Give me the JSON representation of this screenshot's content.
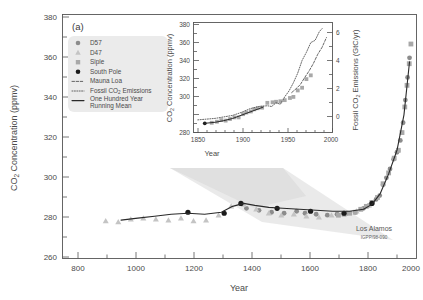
{
  "figure": {
    "panel_label": "(a)",
    "background_color": "#ffffff",
    "credit": {
      "organization": "Los Alamos",
      "report_number": "IGPP/98-090"
    }
  },
  "legend": {
    "background_color": "#ebebeb",
    "items": [
      {
        "label": "D57",
        "marker": "circle",
        "color": "#8c8c8c"
      },
      {
        "label": "D47",
        "marker": "triangle",
        "color": "#c4c4c4"
      },
      {
        "label": "Siple",
        "marker": "square",
        "color": "#a8a8a8"
      },
      {
        "label": "South Pole",
        "marker": "circle",
        "color": "#1a1a1a"
      },
      {
        "label": "Mauna Loa",
        "marker": "dashed-line",
        "color": "#555555"
      },
      {
        "label": "Fossil CO2 Emissions",
        "marker": "dotted-line",
        "color": "#555555"
      },
      {
        "label": "One Hundred Year Running Mean",
        "marker": "solid-line",
        "color": "#2a2a2a"
      }
    ]
  },
  "chart_data": {
    "type": "scatter",
    "title": "",
    "xlabel": "Year",
    "ylabel": "CO2 Concentration (ppmv)",
    "xlim": [
      750,
      2020
    ],
    "ylim": [
      258,
      382
    ],
    "xticks": [
      800,
      1000,
      1200,
      1400,
      1600,
      1800,
      2000
    ],
    "yticks": [
      260,
      280,
      300,
      320,
      340,
      360,
      380
    ],
    "grid": false,
    "legend_position": "upper-left",
    "series": [
      {
        "name": "D57",
        "marker": "circle",
        "color": "#8c8c8c",
        "points": [
          [
            1410,
            283.5
          ],
          [
            1455,
            282.5
          ],
          [
            1500,
            281.5
          ],
          [
            1545,
            281.0
          ],
          [
            1590,
            282.0
          ],
          [
            1620,
            281.0
          ],
          [
            1660,
            280.5
          ],
          [
            1700,
            280.0
          ],
          [
            1735,
            280.5
          ],
          [
            1770,
            281.0
          ],
          [
            1800,
            281.5
          ],
          [
            1830,
            283.5
          ],
          [
            1850,
            285.0
          ],
          [
            1862,
            286.5
          ],
          [
            1875,
            288.0
          ],
          [
            1888,
            290.0
          ],
          [
            1900,
            295.5
          ],
          [
            1912,
            299.0
          ],
          [
            1925,
            303.5
          ],
          [
            1938,
            308.5
          ],
          [
            1950,
            312.0
          ],
          [
            1962,
            318.0
          ],
          [
            1972,
            327.0
          ],
          [
            1980,
            338.5
          ],
          [
            1988,
            350.0
          ],
          [
            1995,
            360.0
          ]
        ]
      },
      {
        "name": "D47",
        "marker": "triangle",
        "color": "#c4c4c4",
        "points": [
          [
            905,
            277.0
          ],
          [
            950,
            276.5
          ],
          [
            995,
            278.0
          ],
          [
            1040,
            278.5
          ],
          [
            1085,
            278.0
          ],
          [
            1130,
            277.5
          ],
          [
            1175,
            278.5
          ],
          [
            1220,
            277.0
          ],
          [
            1265,
            277.5
          ],
          [
            1310,
            280.0
          ],
          [
            1355,
            284.5
          ],
          [
            1400,
            285.5
          ],
          [
            1445,
            283.0
          ],
          [
            1490,
            281.0
          ],
          [
            1535,
            280.0
          ],
          [
            1580,
            280.5
          ],
          [
            1625,
            279.5
          ],
          [
            1670,
            279.0
          ],
          [
            1715,
            280.0
          ],
          [
            1760,
            281.0
          ],
          [
            1805,
            282.0
          ],
          [
            1850,
            285.0
          ]
        ]
      },
      {
        "name": "Siple",
        "marker": "square",
        "color": "#a8a8a8",
        "points": [
          [
            1740,
            280.0
          ],
          [
            1760,
            280.5
          ],
          [
            1780,
            281.0
          ],
          [
            1800,
            281.5
          ],
          [
            1820,
            283.0
          ],
          [
            1840,
            284.5
          ],
          [
            1860,
            286.5
          ],
          [
            1880,
            289.0
          ],
          [
            1900,
            296.0
          ],
          [
            1920,
            301.5
          ],
          [
            1940,
            309.0
          ],
          [
            1955,
            313.0
          ],
          [
            1968,
            322.0
          ],
          [
            1978,
            335.0
          ],
          [
            1986,
            346.0
          ],
          [
            1994,
            357.0
          ],
          [
            2000,
            367.0
          ]
        ]
      },
      {
        "name": "South Pole",
        "marker": "circle",
        "color": "#1a1a1a",
        "points": [
          [
            1200,
            281.5
          ],
          [
            1330,
            281.0
          ],
          [
            1390,
            286.0
          ],
          [
            1520,
            283.5
          ],
          [
            1640,
            282.0
          ],
          [
            1760,
            281.0
          ],
          [
            1860,
            286.0
          ]
        ]
      },
      {
        "name": "One Hundred Year Running Mean",
        "marker": "solid-line",
        "color": "#2a2a2a",
        "points": [
          [
            960,
            277.5
          ],
          [
            1020,
            278.5
          ],
          [
            1080,
            279.5
          ],
          [
            1140,
            280.5
          ],
          [
            1200,
            281.0
          ],
          [
            1260,
            280.5
          ],
          [
            1320,
            281.5
          ],
          [
            1360,
            284.5
          ],
          [
            1400,
            286.0
          ],
          [
            1440,
            285.0
          ],
          [
            1490,
            284.0
          ],
          [
            1540,
            283.5
          ],
          [
            1600,
            283.0
          ],
          [
            1660,
            282.5
          ],
          [
            1720,
            282.0
          ],
          [
            1780,
            282.0
          ],
          [
            1830,
            283.0
          ],
          [
            1860,
            285.5
          ],
          [
            1890,
            291.0
          ],
          [
            1920,
            301.0
          ],
          [
            1950,
            313.0
          ],
          [
            1975,
            331.0
          ],
          [
            1995,
            358.0
          ]
        ]
      }
    ]
  },
  "inset_chart": {
    "type": "line",
    "title": "",
    "xlabel": "Year",
    "ylabel": "CO2 Concentration (ppmv)",
    "ylabel_right": "Fossil CO2 Emissions (GtC/yr)",
    "xlim": [
      1845,
      2005
    ],
    "ylim": [
      278,
      380
    ],
    "ylim_right": [
      -0.8,
      6.6
    ],
    "xticks": [
      1850,
      1900,
      1950,
      2000
    ],
    "yticks": [
      280,
      300,
      320,
      340,
      360,
      380
    ],
    "yticks_right": [
      0,
      2,
      4,
      6
    ],
    "grid": false,
    "series": [
      {
        "name": "Siple",
        "marker": "square",
        "color": "#a8a8a8",
        "points": [
          [
            1866,
            287.0
          ],
          [
            1872,
            288.0
          ],
          [
            1877,
            289.5
          ],
          [
            1882,
            289.0
          ],
          [
            1887,
            290.5
          ],
          [
            1892,
            292.0
          ],
          [
            1897,
            292.0
          ],
          [
            1902,
            295.0
          ],
          [
            1906,
            296.5
          ],
          [
            1911,
            297.5
          ],
          [
            1915,
            299.5
          ],
          [
            1919,
            300.5
          ],
          [
            1924,
            301.0
          ],
          [
            1930,
            305.5
          ],
          [
            1936,
            306.0
          ],
          [
            1940,
            306.5
          ],
          [
            1945,
            307.0
          ],
          [
            1950,
            308.0
          ],
          [
            1956,
            310.0
          ],
          [
            1960,
            311.0
          ],
          [
            1965,
            317.0
          ],
          [
            1970,
            319.5
          ],
          [
            1975,
            327.5
          ],
          [
            1980,
            331.0
          ]
        ]
      },
      {
        "name": "South Pole",
        "marker": "circle",
        "color": "#1a1a1a",
        "points": [
          [
            1858,
            286.5
          ]
        ]
      },
      {
        "name": "One Hundred Year Running Mean",
        "marker": "solid-line",
        "color": "#2a2a2a",
        "points": [
          [
            1858,
            286.5
          ],
          [
            1870,
            287.5
          ],
          [
            1880,
            289.0
          ],
          [
            1890,
            291.0
          ],
          [
            1900,
            294.0
          ],
          [
            1910,
            297.0
          ],
          [
            1920,
            300.0
          ],
          [
            1925,
            301.5
          ]
        ]
      },
      {
        "name": "Mauna Loa",
        "marker": "dashed-line",
        "color": "#555555",
        "points": [
          [
            1958,
            315.0
          ],
          [
            1963,
            318.5
          ],
          [
            1968,
            322.5
          ],
          [
            1973,
            329.0
          ],
          [
            1978,
            335.0
          ],
          [
            1983,
            342.0
          ],
          [
            1988,
            350.5
          ],
          [
            1993,
            357.0
          ],
          [
            1998,
            366.0
          ]
        ]
      },
      {
        "name": "Fossil CO2 Emissions",
        "marker": "dotted-line",
        "axis": "right",
        "points": [
          [
            1850,
            0.05
          ],
          [
            1860,
            0.1
          ],
          [
            1870,
            0.15
          ],
          [
            1880,
            0.25
          ],
          [
            1890,
            0.35
          ],
          [
            1900,
            0.55
          ],
          [
            1910,
            0.8
          ],
          [
            1920,
            0.95
          ],
          [
            1930,
            1.0
          ],
          [
            1935,
            0.95
          ],
          [
            1940,
            1.2
          ],
          [
            1945,
            1.1
          ],
          [
            1950,
            1.6
          ],
          [
            1955,
            2.0
          ],
          [
            1960,
            2.55
          ],
          [
            1965,
            3.2
          ],
          [
            1970,
            4.05
          ],
          [
            1975,
            4.6
          ],
          [
            1980,
            5.25
          ],
          [
            1985,
            5.4
          ],
          [
            1990,
            6.0
          ],
          [
            1994,
            6.25
          ]
        ]
      }
    ]
  }
}
